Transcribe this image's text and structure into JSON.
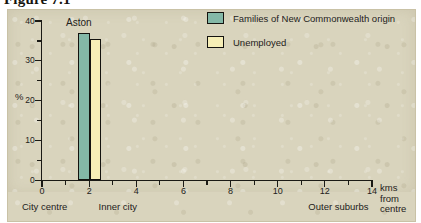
{
  "figure": {
    "caption": "Figure 7.1"
  },
  "legend": {
    "position": "top-right",
    "items": [
      {
        "label": "Families of New Commonwealth origin",
        "color": "#84b8a7",
        "swatch_name": "legend-swatch-families"
      },
      {
        "label": "Unemployed",
        "color": "#f6eeb6",
        "swatch_name": "legend-swatch-unemployed"
      }
    ]
  },
  "axes": {
    "y": {
      "label": "%",
      "ticks": [
        "0",
        "10",
        "20",
        "30",
        "40"
      ],
      "minor_ticks": [
        "5",
        "15",
        "25",
        "35"
      ],
      "range": [
        0,
        40
      ]
    },
    "x": {
      "label_lines": [
        "kms",
        "from",
        "centre"
      ],
      "ticks": [
        "0",
        "2",
        "4",
        "6",
        "8",
        "10",
        "12",
        "14"
      ],
      "minor_ticks": [
        "1",
        "3",
        "5",
        "7",
        "9",
        "11",
        "13"
      ],
      "range": [
        0,
        14
      ]
    }
  },
  "zones": [
    {
      "label": "City centre",
      "at_km": 0
    },
    {
      "label": "Inner city",
      "at_km": 2.4
    },
    {
      "label": "Outer suburbs",
      "at_km": 11.3
    }
  ],
  "bars": {
    "group_label": "Aston",
    "families_value": 37,
    "unemployed_value": 35.4
  },
  "colors": {
    "paper": "#d9d4bd",
    "teal": "#84b8a7",
    "cream": "#f6eeb6",
    "ink": "#1b1a15"
  },
  "chart_data": {
    "type": "bar",
    "title": "Figure 7.1",
    "xlabel": "kms from centre",
    "ylabel": "%",
    "xlim": [
      0,
      14
    ],
    "ylim": [
      0,
      40
    ],
    "grid": false,
    "legend_position": "top-right",
    "categories": [
      "Aston"
    ],
    "category_x_km": [
      2.0
    ],
    "series": [
      {
        "name": "Families of New Commonwealth origin",
        "color": "#84b8a7",
        "values": [
          37
        ]
      },
      {
        "name": "Unemployed",
        "color": "#f6eeb6",
        "values": [
          35.4
        ]
      }
    ],
    "annotations": [
      {
        "text": "Aston",
        "at_km": 2.0,
        "kind": "bar-group-label"
      },
      {
        "text": "City centre",
        "at_km": 0,
        "kind": "zone-label"
      },
      {
        "text": "Inner city",
        "at_km": 2.4,
        "kind": "zone-label"
      },
      {
        "text": "Outer suburbs",
        "at_km": 11.3,
        "kind": "zone-label"
      }
    ],
    "x_tick_values": [
      0,
      2,
      4,
      6,
      8,
      10,
      12,
      14
    ],
    "x_minor_tick_values": [
      1,
      3,
      5,
      7,
      9,
      11,
      13
    ],
    "y_tick_values": [
      0,
      10,
      20,
      30,
      40
    ],
    "y_minor_tick_values": [
      5,
      15,
      25,
      35
    ]
  }
}
